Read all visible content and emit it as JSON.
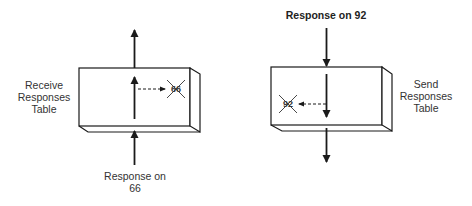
{
  "left_panel": {
    "table_label_lines": [
      "Receive",
      "Responses",
      "Table"
    ],
    "incoming_label_lines": [
      "Response on",
      "66"
    ],
    "crossed_entry": "66"
  },
  "right_panel": {
    "table_label_lines": [
      "Send",
      "Responses",
      "Table"
    ],
    "incoming_label": "Response on 92",
    "crossed_entry": "92"
  },
  "colors": {
    "stroke": "#1a1a1a",
    "background": "#ffffff"
  }
}
